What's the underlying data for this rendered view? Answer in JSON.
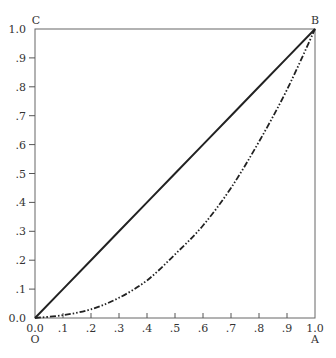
{
  "chart_data": {
    "type": "line",
    "title": "",
    "xlabel": "",
    "ylabel": "",
    "xlim": [
      0,
      1
    ],
    "ylim": [
      0,
      1
    ],
    "grid": false,
    "x_ticks": [
      "0.0",
      ".1",
      ".2",
      ".3",
      ".4",
      ".5",
      ".6",
      ".7",
      ".8",
      ".9",
      "1.0"
    ],
    "y_ticks": [
      "0.0",
      ".1",
      ".2",
      ".3",
      ".4",
      ".5",
      ".6",
      ".7",
      ".8",
      ".9",
      "1.0"
    ],
    "corner_labels": {
      "origin": "O",
      "bottom_right": "A",
      "top_right": "B",
      "top_left": "C"
    },
    "series": [
      {
        "name": "line of equality (OB)",
        "style": "solid",
        "x": [
          0,
          0.1,
          0.2,
          0.3,
          0.4,
          0.5,
          0.6,
          0.7,
          0.8,
          0.9,
          1.0
        ],
        "y": [
          0,
          0.1,
          0.2,
          0.3,
          0.4,
          0.5,
          0.6,
          0.7,
          0.8,
          0.9,
          1.0
        ]
      },
      {
        "name": "Lorenz curve",
        "style": "dash-dot-dot",
        "x": [
          0,
          0.1,
          0.2,
          0.3,
          0.4,
          0.5,
          0.6,
          0.7,
          0.8,
          0.9,
          1.0
        ],
        "y": [
          0,
          0.01,
          0.03,
          0.07,
          0.13,
          0.22,
          0.32,
          0.45,
          0.61,
          0.79,
          1.0
        ]
      }
    ]
  }
}
